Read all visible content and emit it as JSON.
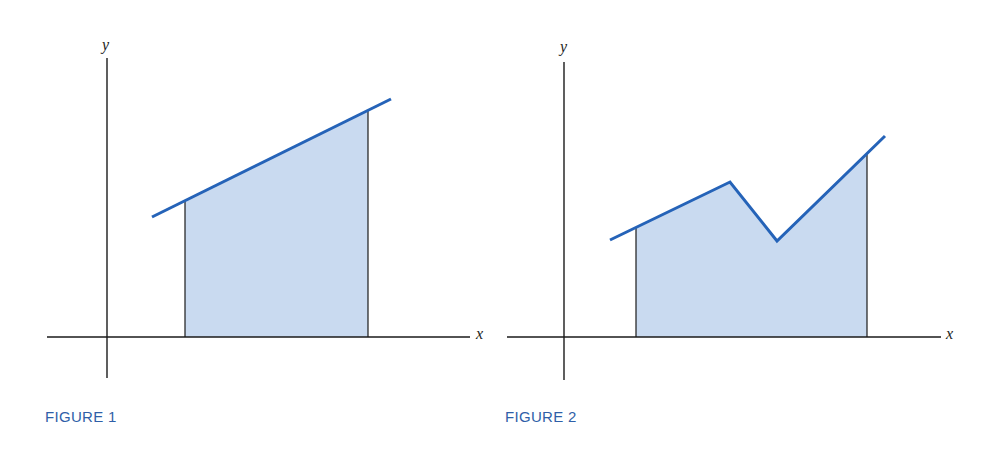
{
  "colors": {
    "curve": "#2563b8",
    "fill": "#c9daf0",
    "axis": "#1a1a1a",
    "caption": "#2f5fa8"
  },
  "figures": [
    {
      "caption": "FIGURE 1",
      "x_label": "x",
      "y_label": "y",
      "description": "Area under a straight line between two vertical bounds"
    },
    {
      "caption": "FIGURE 2",
      "x_label": "x",
      "y_label": "y",
      "description": "Area under a piecewise-linear curve between two vertical bounds"
    }
  ]
}
